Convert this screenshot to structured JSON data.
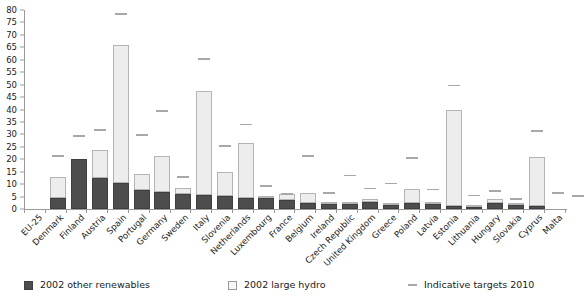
{
  "chart_data": {
    "type": "bar",
    "title": "",
    "subtitle": "",
    "xlabel": "",
    "ylabel": "",
    "ylim": [
      0,
      80
    ],
    "ytick_step": 5,
    "grid": false,
    "stacked": true,
    "legend_position": "bottom",
    "yticks": [
      "0",
      "5",
      "10",
      "15",
      "20",
      "25",
      "30",
      "35",
      "40",
      "45",
      "50",
      "55",
      "60",
      "65",
      "70",
      "75",
      "80"
    ],
    "categories": [
      "EU-25",
      "Denmark",
      "Finland",
      "Austria",
      "Spain",
      "Portugal",
      "Germany",
      "Sweden",
      "Italy",
      "Slovenia",
      "Netherlands",
      "Luxembourg",
      "France",
      "Belgium",
      "Ireland",
      "Czech Republic",
      "United Kingdom",
      "Greece",
      "Poland",
      "Latvia",
      "Estonia",
      "Lithuania",
      "Hungary",
      "Slovakia",
      "Cyprus",
      "Malta"
    ],
    "series": [
      {
        "name": "2002 other renewables",
        "color": "#4d4d4d",
        "values": [
          4.5,
          20.2,
          12.4,
          10.6,
          7.6,
          6.9,
          5.9,
          5.8,
          5.4,
          4.6,
          4.3,
          3.5,
          2.3,
          2.1,
          1.9,
          2.9,
          1.6,
          2.5,
          1.9,
          1.3,
          0.9,
          2.3,
          1.5,
          1.1,
          0.0,
          0.0
        ]
      },
      {
        "name": "2002 large hydro",
        "color": "#ededed",
        "values": [
          8.3,
          0.0,
          11.5,
          55.5,
          6.6,
          14.6,
          2.6,
          41.6,
          9.6,
          21.9,
          0.1,
          2.7,
          4.1,
          0.1,
          0.4,
          1.0,
          0.6,
          5.6,
          0.6,
          38.7,
          0.3,
          1.9,
          0.3,
          19.9,
          0.0,
          0.0
        ]
      }
    ],
    "targets": {
      "name": "Indicative targets 2010",
      "color": "#a8a8a8",
      "values": [
        21.0,
        29.0,
        31.5,
        78.1,
        29.4,
        39.0,
        12.5,
        60.0,
        25.0,
        33.6,
        9.0,
        5.7,
        21.0,
        6.0,
        13.2,
        8.0,
        10.0,
        20.1,
        7.5,
        49.3,
        5.1,
        7.0,
        3.6,
        31.0,
        6.0,
        5.0
      ]
    }
  },
  "legend": {
    "items": [
      {
        "label": "2002 other renewables",
        "icon": "square-filled-icon"
      },
      {
        "label": "2002  large hydro",
        "icon": "square-outline-icon"
      },
      {
        "label": "Indicative targets 2010",
        "icon": "dash-line-icon"
      }
    ]
  }
}
